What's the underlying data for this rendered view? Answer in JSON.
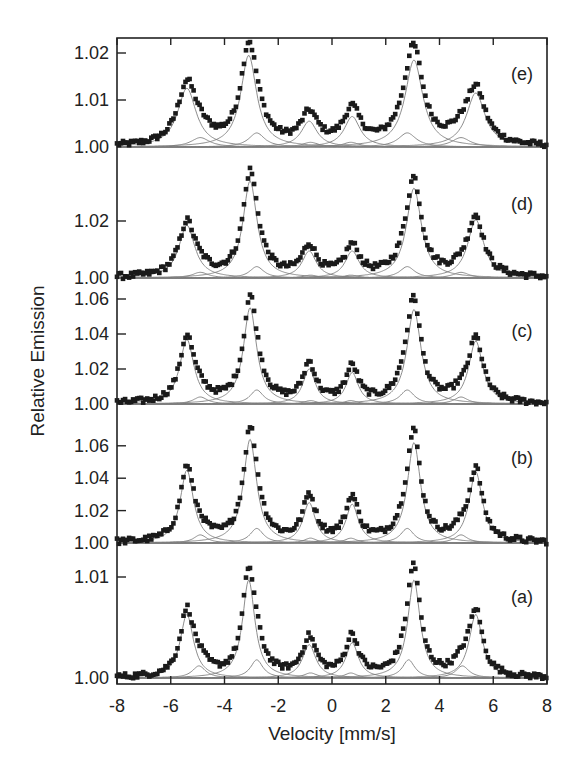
{
  "chart_data": {
    "type": "scatter",
    "title": "",
    "xlabel": "Velocity [mm/s]",
    "ylabel": "Relative Emission",
    "xlim": [
      -8,
      8
    ],
    "x_ticks": [
      -8,
      -6,
      -4,
      -2,
      0,
      2,
      4,
      6,
      8
    ],
    "grid": false,
    "legend": null,
    "colors": {
      "data": "#1a1a1a",
      "fit": "#808080",
      "axis": "#222222"
    },
    "panels": [
      {
        "label": "(e)",
        "y_ticks": [
          "1.00",
          "1.01",
          "1.02"
        ],
        "ylim": [
          0.998,
          1.022
        ],
        "baseline": 1.0,
        "peaks": [
          {
            "x": -5.4,
            "y": 1.0125,
            "width": 0.42
          },
          {
            "x": -3.1,
            "y": 1.0195,
            "width": 0.36
          },
          {
            "x": -0.85,
            "y": 1.0055,
            "width": 0.36
          },
          {
            "x": 0.75,
            "y": 1.0065,
            "width": 0.36
          },
          {
            "x": 3.05,
            "y": 1.0185,
            "width": 0.4
          },
          {
            "x": 5.35,
            "y": 1.0115,
            "width": 0.42
          }
        ],
        "secondary_peaks": [
          {
            "x": -4.9,
            "y": 1.002
          },
          {
            "x": -2.8,
            "y": 1.003
          },
          {
            "x": -0.8,
            "y": 1.001
          },
          {
            "x": 0.7,
            "y": 1.001
          },
          {
            "x": 2.8,
            "y": 1.003
          },
          {
            "x": 4.8,
            "y": 1.002
          }
        ]
      },
      {
        "label": "(d)",
        "y_ticks": [
          "1.00",
          "1.02"
        ],
        "ylim": [
          0.996,
          1.04
        ],
        "baseline": 1.0,
        "peaks": [
          {
            "x": -5.4,
            "y": 1.0185,
            "width": 0.36
          },
          {
            "x": -3.05,
            "y": 1.034,
            "width": 0.32
          },
          {
            "x": -0.85,
            "y": 1.0095,
            "width": 0.32
          },
          {
            "x": 0.75,
            "y": 1.0095,
            "width": 0.32
          },
          {
            "x": 3.05,
            "y": 1.0315,
            "width": 0.34
          },
          {
            "x": 5.35,
            "y": 1.0205,
            "width": 0.36
          }
        ],
        "secondary_peaks": [
          {
            "x": -4.9,
            "y": 1.002
          },
          {
            "x": -2.8,
            "y": 1.004
          },
          {
            "x": -0.8,
            "y": 1.001
          },
          {
            "x": 0.7,
            "y": 1.001
          },
          {
            "x": 2.8,
            "y": 1.004
          },
          {
            "x": 4.8,
            "y": 1.002
          }
        ]
      },
      {
        "label": "(c)",
        "y_ticks": [
          "1.00",
          "1.02",
          "1.04",
          "1.06"
        ],
        "ylim": [
          0.996,
          1.064
        ],
        "baseline": 1.0,
        "peaks": [
          {
            "x": -5.4,
            "y": 1.037,
            "width": 0.32
          },
          {
            "x": -3.05,
            "y": 1.055,
            "width": 0.3
          },
          {
            "x": -0.85,
            "y": 1.02,
            "width": 0.28
          },
          {
            "x": 0.75,
            "y": 1.018,
            "width": 0.28
          },
          {
            "x": 3.05,
            "y": 1.054,
            "width": 0.32
          },
          {
            "x": 5.35,
            "y": 1.036,
            "width": 0.32
          }
        ],
        "secondary_peaks": [
          {
            "x": -4.9,
            "y": 1.004
          },
          {
            "x": -2.8,
            "y": 1.008
          },
          {
            "x": -0.8,
            "y": 1.002
          },
          {
            "x": 0.7,
            "y": 1.002
          },
          {
            "x": 2.8,
            "y": 1.008
          },
          {
            "x": 4.8,
            "y": 1.004
          }
        ]
      },
      {
        "label": "(b)",
        "y_ticks": [
          "1.00",
          "1.02",
          "1.04",
          "1.06"
        ],
        "ylim": [
          0.997,
          1.072
        ],
        "baseline": 1.0,
        "peaks": [
          {
            "x": -5.4,
            "y": 1.045,
            "width": 0.3
          },
          {
            "x": -3.05,
            "y": 1.064,
            "width": 0.3
          },
          {
            "x": -0.85,
            "y": 1.025,
            "width": 0.28
          },
          {
            "x": 0.75,
            "y": 1.024,
            "width": 0.28
          },
          {
            "x": 3.05,
            "y": 1.062,
            "width": 0.3
          },
          {
            "x": 5.35,
            "y": 1.044,
            "width": 0.3
          }
        ],
        "secondary_peaks": [
          {
            "x": -4.9,
            "y": 1.005
          },
          {
            "x": -2.8,
            "y": 1.009
          },
          {
            "x": -0.8,
            "y": 1.003
          },
          {
            "x": 0.7,
            "y": 1.003
          },
          {
            "x": 2.8,
            "y": 1.009
          },
          {
            "x": 4.8,
            "y": 1.005
          }
        ]
      },
      {
        "label": "(a)",
        "y_ticks": [
          "1.00",
          "1.01"
        ],
        "ylim": [
          0.9994,
          1.011
        ],
        "baseline": 1.0,
        "peaks": [
          {
            "x": -5.4,
            "y": 1.0063,
            "width": 0.3
          },
          {
            "x": -3.1,
            "y": 1.0097,
            "width": 0.28
          },
          {
            "x": -0.85,
            "y": 1.0033,
            "width": 0.3
          },
          {
            "x": 0.75,
            "y": 1.0035,
            "width": 0.28
          },
          {
            "x": 3.05,
            "y": 1.0097,
            "width": 0.28
          },
          {
            "x": 5.35,
            "y": 1.0063,
            "width": 0.3
          }
        ],
        "secondary_peaks": [
          {
            "x": -4.95,
            "y": 1.0012
          },
          {
            "x": -2.8,
            "y": 1.0018
          },
          {
            "x": -0.8,
            "y": 1.0005
          },
          {
            "x": 0.7,
            "y": 1.0005
          },
          {
            "x": 2.85,
            "y": 1.0018
          },
          {
            "x": 4.85,
            "y": 1.0012
          }
        ]
      }
    ]
  }
}
